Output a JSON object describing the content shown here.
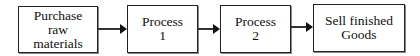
{
  "diagram": {
    "type": "flowchart",
    "direction": "left-to-right",
    "nodes": [
      {
        "id": "n1",
        "lines": [
          "Purchase",
          "raw",
          "materials"
        ]
      },
      {
        "id": "n2",
        "lines": [
          "Process",
          "1"
        ]
      },
      {
        "id": "n3",
        "lines": [
          "Process",
          "2"
        ]
      },
      {
        "id": "n4",
        "lines": [
          "Sell finished",
          "Goods"
        ]
      }
    ],
    "edges": [
      {
        "from": "n1",
        "to": "n2"
      },
      {
        "from": "n2",
        "to": "n3"
      },
      {
        "from": "n3",
        "to": "n4"
      }
    ],
    "colors": {
      "stroke": "#222222",
      "fill": "#ffffff",
      "text": "#111111"
    }
  }
}
